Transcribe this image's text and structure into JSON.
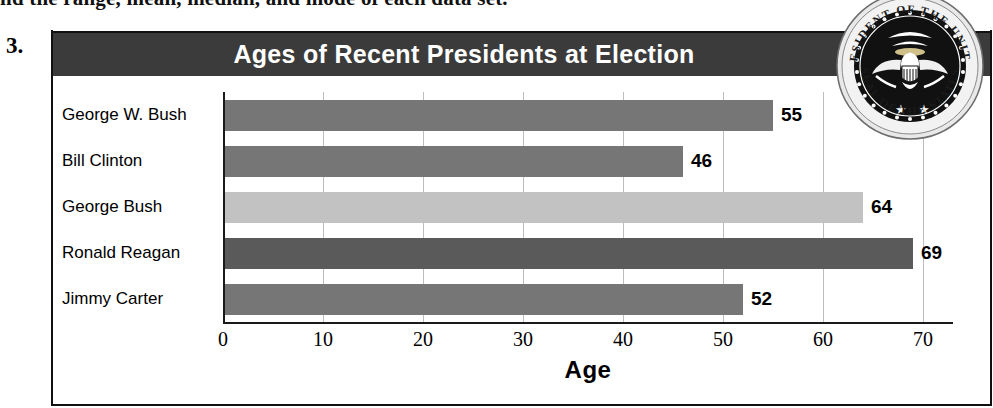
{
  "worksheet": {
    "cutoff_instruction": "nd the range, mean, median, and mode of each data set.",
    "problem_number": "3."
  },
  "seal": {
    "name": "presidential-seal",
    "text_outer": "SEAL OF THE PRESIDENT OF THE UNITED STATES"
  },
  "colors": {
    "title_bar": "#3b3b3b",
    "bar_medium": "#767676",
    "bar_light": "#c2c2c2",
    "bar_dark": "#5a5a5a",
    "gridline": "#bdbdbd",
    "axis": "#1a1a1a",
    "frame": "#111111"
  },
  "chart_data": {
    "type": "bar",
    "orientation": "horizontal",
    "title": "Ages of Recent Presidents at Election",
    "xlabel": "Age",
    "ylabel": "",
    "categories": [
      "George W. Bush",
      "Bill Clinton",
      "George Bush",
      "Ronald Reagan",
      "Jimmy Carter"
    ],
    "values": [
      55,
      46,
      64,
      69,
      52
    ],
    "bar_colors": [
      "#767676",
      "#767676",
      "#c2c2c2",
      "#5a5a5a",
      "#767676"
    ],
    "data_labels": [
      "55",
      "46",
      "64",
      "69",
      "52"
    ],
    "xlim": [
      0,
      73
    ],
    "xticks": [
      0,
      10,
      20,
      30,
      40,
      50,
      60,
      70
    ],
    "xtick_labels": [
      "0",
      "10",
      "20",
      "30",
      "40",
      "50",
      "60",
      "70"
    ],
    "grid": "vertical",
    "legend": "none"
  }
}
